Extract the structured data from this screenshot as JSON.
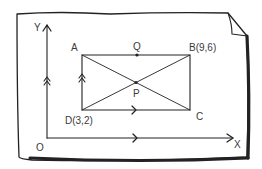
{
  "diagram": {
    "type": "coordinate-geometry rectangle on curled paper",
    "colors": {
      "ink": "#222222",
      "label": "#3a3a3a",
      "paper": "#ffffff"
    },
    "axes": {
      "x_label": "X",
      "y_label": "Y",
      "origin_label": "O"
    },
    "points": {
      "A": {
        "label": "A"
      },
      "B": {
        "label": "B(9,6)"
      },
      "C": {
        "label": "C"
      },
      "D": {
        "label": "D(3,2)"
      },
      "P": {
        "label": "P"
      },
      "Q": {
        "label": "Q"
      }
    },
    "markers": {
      "y_axis_arrow": "double-chevron-up",
      "ad_arrow": "double-chevron-up",
      "dc_arrow": "chevron-right",
      "x_axis_arrow": "chevron-right"
    }
  }
}
